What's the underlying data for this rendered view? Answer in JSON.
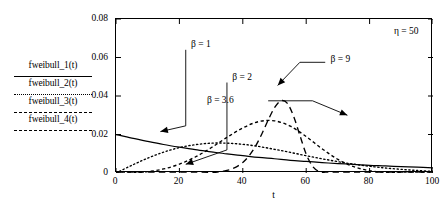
{
  "legend": {
    "items": [
      {
        "label": "fweibull_1(t)",
        "style": "solid",
        "icon": "solid-line-icon"
      },
      {
        "label": "fweibull_2(t)",
        "style": "dotted",
        "icon": "dotted-line-icon"
      },
      {
        "label": "fweibull_3(t)",
        "style": "dashed-small",
        "icon": "small-dashed-line-icon"
      },
      {
        "label": "fweibull_4(t)",
        "style": "dashed-long",
        "icon": "long-dashed-line-icon"
      }
    ]
  },
  "chart_data": {
    "type": "line",
    "title": "",
    "xlabel": "t",
    "ylabel": "",
    "xlim": [
      0,
      100
    ],
    "ylim": [
      0,
      0.08
    ],
    "xticks": [
      "0",
      "20",
      "40",
      "60",
      "80",
      "100"
    ],
    "xtick_values": [
      0,
      20,
      40,
      60,
      80,
      100
    ],
    "yticks": [
      "0",
      "0.02",
      "0.04",
      "0.06",
      "0.08"
    ],
    "ytick_values": [
      0,
      0.02,
      0.04,
      0.06,
      0.08
    ],
    "grid": false,
    "legend_position": "left-outside",
    "annotations": [
      {
        "text": "η = 50",
        "x": 88,
        "y": 0.0735,
        "kind": "parameter-note"
      },
      {
        "text": "β = 1",
        "x": 24,
        "y": 0.0665,
        "kind": "curve-callout",
        "target_series": "fweibull_1(t)"
      },
      {
        "text": "β = 2",
        "x": 37,
        "y": 0.0495,
        "kind": "curve-callout",
        "target_series": "fweibull_2(t)"
      },
      {
        "text": "β = 3.6",
        "x": 29,
        "y": 0.0375,
        "kind": "curve-callout",
        "target_series": "fweibull_3(t)"
      },
      {
        "text": "β = 9",
        "x": 68,
        "y": 0.0588,
        "kind": "curve-callout",
        "target_series": "fweibull_4(t)"
      }
    ],
    "series": [
      {
        "name": "fweibull_1(t)",
        "beta": 1,
        "eta": 50,
        "style": "solid",
        "x": [
          0,
          5,
          10,
          15,
          20,
          25,
          30,
          35,
          40,
          45,
          50,
          55,
          60,
          65,
          70,
          75,
          80,
          85,
          90,
          95,
          100
        ],
        "values": [
          0.02,
          0.0181,
          0.0164,
          0.0148,
          0.0134,
          0.0121,
          0.011,
          0.0099,
          0.009,
          0.0081,
          0.0074,
          0.0066,
          0.006,
          0.0054,
          0.0049,
          0.0045,
          0.004,
          0.0037,
          0.0033,
          0.003,
          0.0027
        ]
      },
      {
        "name": "fweibull_2(t)",
        "beta": 2,
        "eta": 50,
        "style": "dotted",
        "x": [
          0,
          5,
          10,
          15,
          20,
          25,
          30,
          35,
          40,
          45,
          50,
          55,
          60,
          65,
          70,
          75,
          80,
          85,
          90,
          95,
          100
        ],
        "values": [
          0.0,
          0.004,
          0.0077,
          0.0108,
          0.0132,
          0.0147,
          0.0155,
          0.0155,
          0.0149,
          0.0138,
          0.0123,
          0.0107,
          0.009,
          0.0074,
          0.0059,
          0.0046,
          0.0035,
          0.0026,
          0.0019,
          0.0013,
          0.0009
        ]
      },
      {
        "name": "fweibull_3(t)",
        "beta": 3.6,
        "eta": 50,
        "style": "dashed-small",
        "x": [
          0,
          5,
          10,
          15,
          20,
          25,
          30,
          35,
          40,
          45,
          50,
          55,
          60,
          65,
          70,
          75,
          80,
          85,
          90,
          95,
          100
        ],
        "values": [
          0.0,
          0.0001,
          0.0007,
          0.0021,
          0.0046,
          0.0083,
          0.0131,
          0.0185,
          0.0234,
          0.0267,
          0.0271,
          0.0243,
          0.0189,
          0.0126,
          0.0071,
          0.0033,
          0.0012,
          0.0003,
          0.0001,
          0.0,
          0.0
        ]
      },
      {
        "name": "fweibull_4(t)",
        "beta": 9,
        "eta": 50,
        "style": "dashed-long",
        "x": [
          0,
          5,
          10,
          15,
          20,
          25,
          30,
          32,
          34,
          36,
          38,
          40,
          42,
          44,
          46,
          48,
          50,
          52,
          54,
          56,
          58,
          60,
          62,
          64,
          66,
          68,
          70,
          75,
          80,
          100
        ],
        "values": [
          0.0,
          0.0,
          0.0,
          0.0,
          0.0,
          0.0,
          0.0003,
          0.0005,
          0.001,
          0.0018,
          0.0032,
          0.0055,
          0.009,
          0.0139,
          0.0203,
          0.0275,
          0.0339,
          0.0375,
          0.0363,
          0.0296,
          0.0196,
          0.0098,
          0.0035,
          0.0008,
          0.0001,
          0.0,
          0.0,
          0.0,
          0.0,
          0.0
        ]
      }
    ]
  }
}
